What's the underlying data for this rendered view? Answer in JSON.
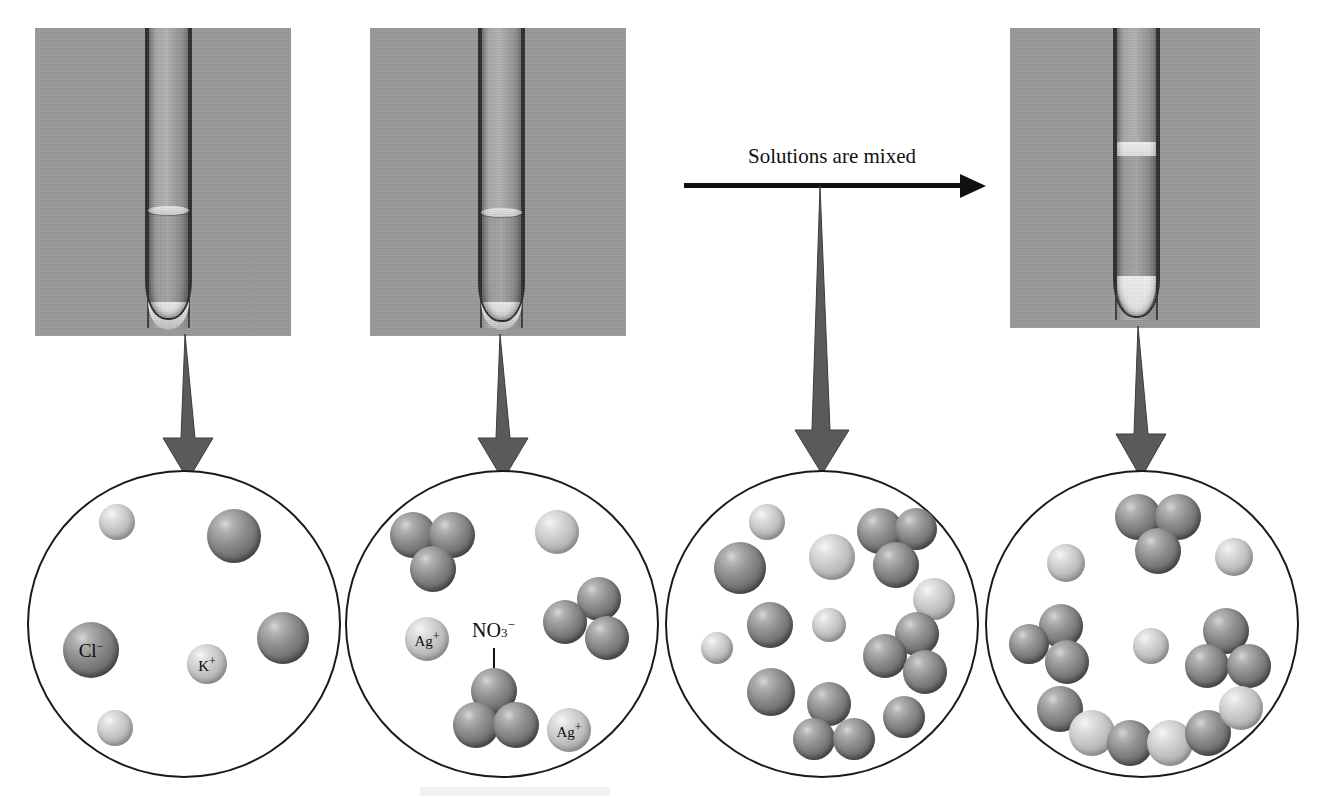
{
  "figure": {
    "background": "#ffffff",
    "photo_bg": "#9a9a9a",
    "ink": "#111111",
    "arrow_fill": "#5a5a5a",
    "sphere_dark": "#8f8f8f",
    "sphere_light": "#c9c9c9"
  },
  "mix_arrow": {
    "label": "Solutions are mixed",
    "name": "solutions-are-mixed-arrow"
  },
  "panels": [
    {
      "id": "kcl",
      "caption": "",
      "tube_label": "potassium chloride solution test tube"
    },
    {
      "id": "agno3",
      "caption": "",
      "tube_label": "silver nitrate solution test tube"
    },
    {
      "id": "precipitate",
      "caption": "",
      "tube_label": "test tube with white silver chloride precipitate"
    }
  ],
  "circles": [
    {
      "id": "circle-kcl",
      "name": "magnified-view-kcl",
      "labels": [
        {
          "text": "Cl",
          "charge": "−",
          "species": "chloride-ion"
        },
        {
          "text": "K",
          "charge": "+",
          "species": "potassium-ion"
        }
      ],
      "ion_counts": {
        "chloride": 3,
        "potassium": 3
      }
    },
    {
      "id": "circle-agno3",
      "name": "magnified-view-agno3",
      "labels": [
        {
          "text": "Ag",
          "charge": "+",
          "species": "silver-ion"
        },
        {
          "text": "Ag",
          "charge": "+",
          "species": "silver-ion"
        }
      ],
      "callout": {
        "text": "NO",
        "sub": "3",
        "charge": "−",
        "species": "nitrate-ion"
      },
      "ion_counts": {
        "silver": 3,
        "nitrate": 3
      }
    },
    {
      "id": "circle-mixed",
      "name": "magnified-view-mixed-solutions",
      "labels": [],
      "ion_counts": {
        "silver": 6,
        "chloride": 5,
        "nitrate": 3
      }
    },
    {
      "id": "circle-precipitate",
      "name": "magnified-view-precipitate",
      "labels": [],
      "ion_counts": {
        "potassium": 3,
        "nitrate": 4,
        "agcl_precipitate": 7
      }
    }
  ],
  "down_arrows": [
    {
      "name": "zoom-arrow-kcl"
    },
    {
      "name": "zoom-arrow-agno3"
    },
    {
      "name": "zoom-arrow-mixed"
    },
    {
      "name": "zoom-arrow-precipitate"
    }
  ]
}
